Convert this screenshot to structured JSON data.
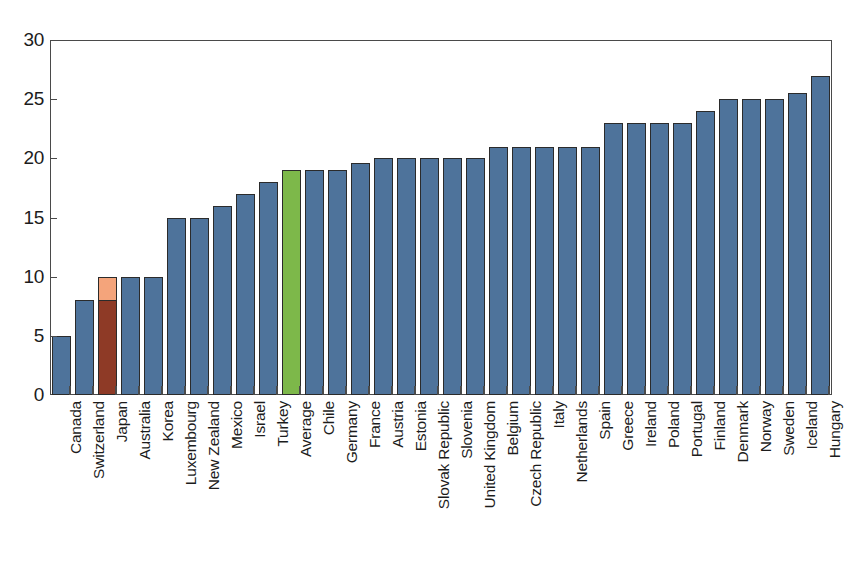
{
  "chart_data": {
    "type": "bar",
    "title": "",
    "subtitle": "",
    "xlabel": "",
    "ylabel": "",
    "ylim": [
      0,
      30
    ],
    "yticks": [
      0,
      5,
      10,
      15,
      20,
      25,
      30
    ],
    "ytick_labels": [
      "0",
      "5",
      "10",
      "15",
      "20",
      "25",
      "30"
    ],
    "grid": false,
    "legend": null,
    "legend_position": "none",
    "colors": {
      "default_bar": "#4e739b",
      "bar_border": "#2b2b2b",
      "highlight_average": "#7db84a",
      "highlight_japan_lower": "#8e3a26",
      "highlight_japan_upper": "#f4a47b",
      "axis": "#4a4a4a",
      "text": "#1c1c1c",
      "background": "#ffffff"
    },
    "categories": [
      "Canada",
      "Switzerland",
      "Japan",
      "Australia",
      "Korea",
      "Luxembourg",
      "New Zealand",
      "Mexico",
      "Israel",
      "Turkey",
      "Average",
      "Chile",
      "Germany",
      "France",
      "Austria",
      "Estonia",
      "Slovak Republic",
      "Slovenia",
      "United Kingdom",
      "Belgium",
      "Czech Republic",
      "Italy",
      "Netherlands",
      "Spain",
      "Greece",
      "Ireland",
      "Poland",
      "Portugal",
      "Finland",
      "Denmark",
      "Norway",
      "Sweden",
      "Iceland",
      "Hungary"
    ],
    "values": [
      5,
      8,
      10,
      10,
      10,
      15,
      15,
      16,
      17,
      18,
      19,
      19,
      19,
      19.6,
      20,
      20,
      20,
      20,
      20,
      21,
      21,
      21,
      21,
      21,
      23,
      23,
      23,
      23,
      24,
      25,
      25,
      25,
      25.5,
      27
    ],
    "bars": [
      {
        "label": "Canada",
        "value": 5,
        "color_key": "default_bar"
      },
      {
        "label": "Switzerland",
        "value": 8,
        "color_key": "default_bar"
      },
      {
        "label": "Japan",
        "value": 10,
        "color_key": "highlight_japan_upper",
        "segment_value": 8,
        "segment_color_key": "highlight_japan_lower"
      },
      {
        "label": "Australia",
        "value": 10,
        "color_key": "default_bar"
      },
      {
        "label": "Korea",
        "value": 10,
        "color_key": "default_bar"
      },
      {
        "label": "Luxembourg",
        "value": 15,
        "color_key": "default_bar"
      },
      {
        "label": "New Zealand",
        "value": 15,
        "color_key": "default_bar"
      },
      {
        "label": "Mexico",
        "value": 16,
        "color_key": "default_bar"
      },
      {
        "label": "Israel",
        "value": 17,
        "color_key": "default_bar"
      },
      {
        "label": "Turkey",
        "value": 18,
        "color_key": "default_bar"
      },
      {
        "label": "Average",
        "value": 19,
        "color_key": "highlight_average"
      },
      {
        "label": "Chile",
        "value": 19,
        "color_key": "default_bar"
      },
      {
        "label": "Germany",
        "value": 19,
        "color_key": "default_bar"
      },
      {
        "label": "France",
        "value": 19.6,
        "color_key": "default_bar"
      },
      {
        "label": "Austria",
        "value": 20,
        "color_key": "default_bar"
      },
      {
        "label": "Estonia",
        "value": 20,
        "color_key": "default_bar"
      },
      {
        "label": "Slovak Republic",
        "value": 20,
        "color_key": "default_bar"
      },
      {
        "label": "Slovenia",
        "value": 20,
        "color_key": "default_bar"
      },
      {
        "label": "United Kingdom",
        "value": 20,
        "color_key": "default_bar"
      },
      {
        "label": "Belgium",
        "value": 21,
        "color_key": "default_bar"
      },
      {
        "label": "Czech Republic",
        "value": 21,
        "color_key": "default_bar"
      },
      {
        "label": "Italy",
        "value": 21,
        "color_key": "default_bar"
      },
      {
        "label": "Netherlands",
        "value": 21,
        "color_key": "default_bar"
      },
      {
        "label": "Spain",
        "value": 21,
        "color_key": "default_bar"
      },
      {
        "label": "Greece",
        "value": 23,
        "color_key": "default_bar"
      },
      {
        "label": "Ireland",
        "value": 23,
        "color_key": "default_bar"
      },
      {
        "label": "Poland",
        "value": 23,
        "color_key": "default_bar"
      },
      {
        "label": "Portugal",
        "value": 23,
        "color_key": "default_bar"
      },
      {
        "label": "Finland",
        "value": 24,
        "color_key": "default_bar"
      },
      {
        "label": "Denmark",
        "value": 25,
        "color_key": "default_bar"
      },
      {
        "label": "Norway",
        "value": 25,
        "color_key": "default_bar"
      },
      {
        "label": "Sweden",
        "value": 25,
        "color_key": "default_bar"
      },
      {
        "label": "Iceland",
        "value": 25.5,
        "color_key": "default_bar"
      },
      {
        "label": "Hungary",
        "value": 27,
        "color_key": "default_bar"
      }
    ]
  }
}
